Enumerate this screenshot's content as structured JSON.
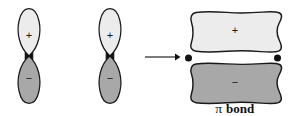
{
  "figure": {
    "background_color": "#ffffff",
    "outline_color": "#1a1a1a",
    "positive_lobe_color": "#ececec",
    "negative_lobe_color": "#a8a8a8",
    "node_dot_color": "#111111",
    "arrow_color": "#111111"
  },
  "orbitals": [
    {
      "name": "p-orbital-left",
      "center_x": 29,
      "top_lobe_sign": "+",
      "bottom_lobe_sign": "−"
    },
    {
      "name": "p-orbital-right",
      "center_x": 110,
      "top_lobe_sign": "+",
      "bottom_lobe_sign": "−"
    }
  ],
  "arrow": {
    "name": "reaction-arrow",
    "label": "",
    "direction": "right",
    "x_start": 145,
    "x_end": 178,
    "y": 57
  },
  "pi_bond": {
    "name": "pi-bond-molecular-orbital",
    "top_lobe_sign": "+",
    "bottom_lobe_sign": "−",
    "nuclei_dot_count": 2,
    "caption_pi": "π",
    "caption_word": "bond",
    "caption_full": "π bond"
  }
}
